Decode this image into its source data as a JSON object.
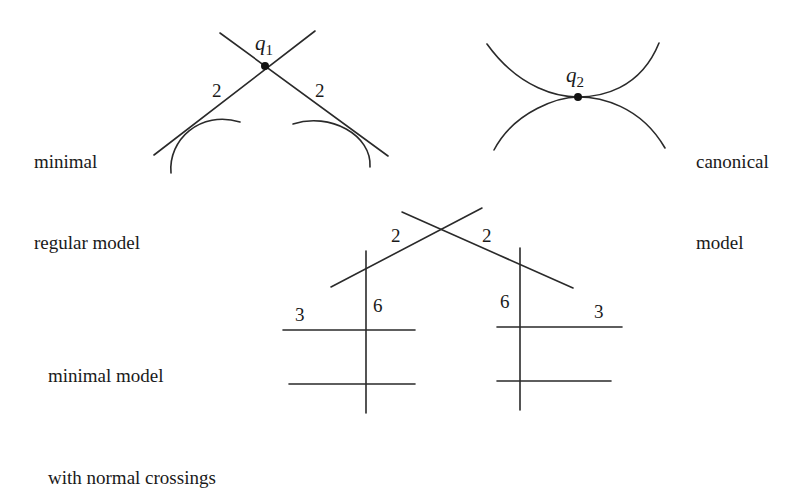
{
  "labels": {
    "minimal_regular": [
      "minimal",
      "regular model"
    ],
    "canonical": [
      "canonical",
      "model"
    ],
    "normal_crossings": [
      "minimal model",
      "with normal crossings"
    ]
  },
  "points": {
    "q1": {
      "base": "q",
      "sub": "1"
    },
    "q2": {
      "base": "q",
      "sub": "2"
    }
  },
  "multiplicities": {
    "regular_left": "2",
    "regular_right": "2",
    "nc_top_left": "2",
    "nc_top_right": "2",
    "nc_left_vertical": "6",
    "nc_right_vertical": "6",
    "nc_left_horizontal": "3",
    "nc_right_horizontal": "3"
  }
}
